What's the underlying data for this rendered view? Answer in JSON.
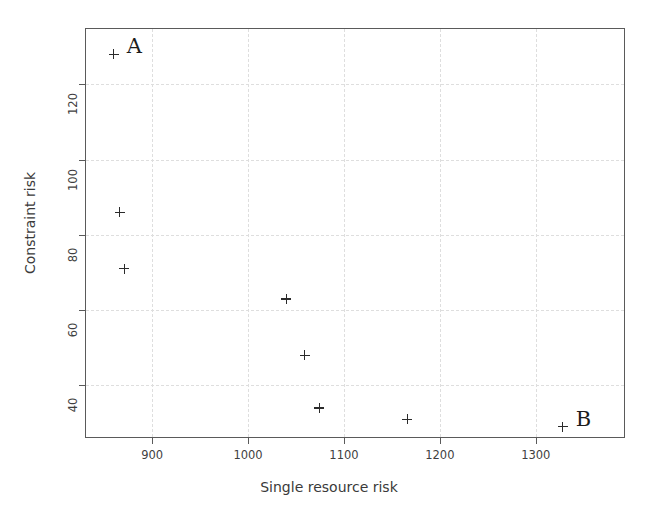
{
  "chart_data": {
    "type": "scatter",
    "title": "",
    "xlabel": "Single resource risk",
    "ylabel": "Constraint risk",
    "xlim": [
      830,
      1393
    ],
    "ylim": [
      26,
      135
    ],
    "xticks": [
      900,
      1000,
      1100,
      1200,
      1300
    ],
    "yticks": [
      40,
      60,
      80,
      100,
      120
    ],
    "xtick_labels": [
      "900",
      "1000",
      "1100",
      "1200",
      "1300"
    ],
    "ytick_labels": [
      "40",
      "60",
      "80",
      "100",
      "120"
    ],
    "grid": true,
    "grid_style": "dashed",
    "legend": "none",
    "marker": "plus",
    "marker_color": "#2b2b2b",
    "series": [
      {
        "name": "solutions",
        "x": [
          860,
          866,
          871,
          1040,
          1059,
          1074,
          1166,
          1328
        ],
        "y": [
          128,
          86,
          71,
          63,
          48,
          34,
          31,
          29
        ]
      }
    ],
    "points": [
      {
        "x": 860,
        "y": 128,
        "label": "A",
        "label_dx": 13,
        "label_dy": -18
      },
      {
        "x": 866,
        "y": 86,
        "label": "",
        "label_dx": 0,
        "label_dy": 0
      },
      {
        "x": 871,
        "y": 71,
        "label": "",
        "label_dx": 0,
        "label_dy": 0
      },
      {
        "x": 1040,
        "y": 63,
        "label": "",
        "label_dx": 0,
        "label_dy": 0
      },
      {
        "x": 1059,
        "y": 48,
        "label": "",
        "label_dx": 0,
        "label_dy": 0
      },
      {
        "x": 1074,
        "y": 34,
        "label": "",
        "label_dx": 0,
        "label_dy": 0
      },
      {
        "x": 1166,
        "y": 31,
        "label": "",
        "label_dx": 0,
        "label_dy": 0
      },
      {
        "x": 1328,
        "y": 29,
        "label": "B",
        "label_dx": 13,
        "label_dy": -18
      }
    ],
    "annotations": [
      {
        "text": "A",
        "x": 860,
        "y": 128
      },
      {
        "text": "B",
        "x": 1328,
        "y": 29
      }
    ]
  },
  "figure": {
    "background_color": "#ffffff",
    "axes_color": "#5a5a5a",
    "grid_color": "#dedede",
    "text_color": "#3a3a3a"
  }
}
